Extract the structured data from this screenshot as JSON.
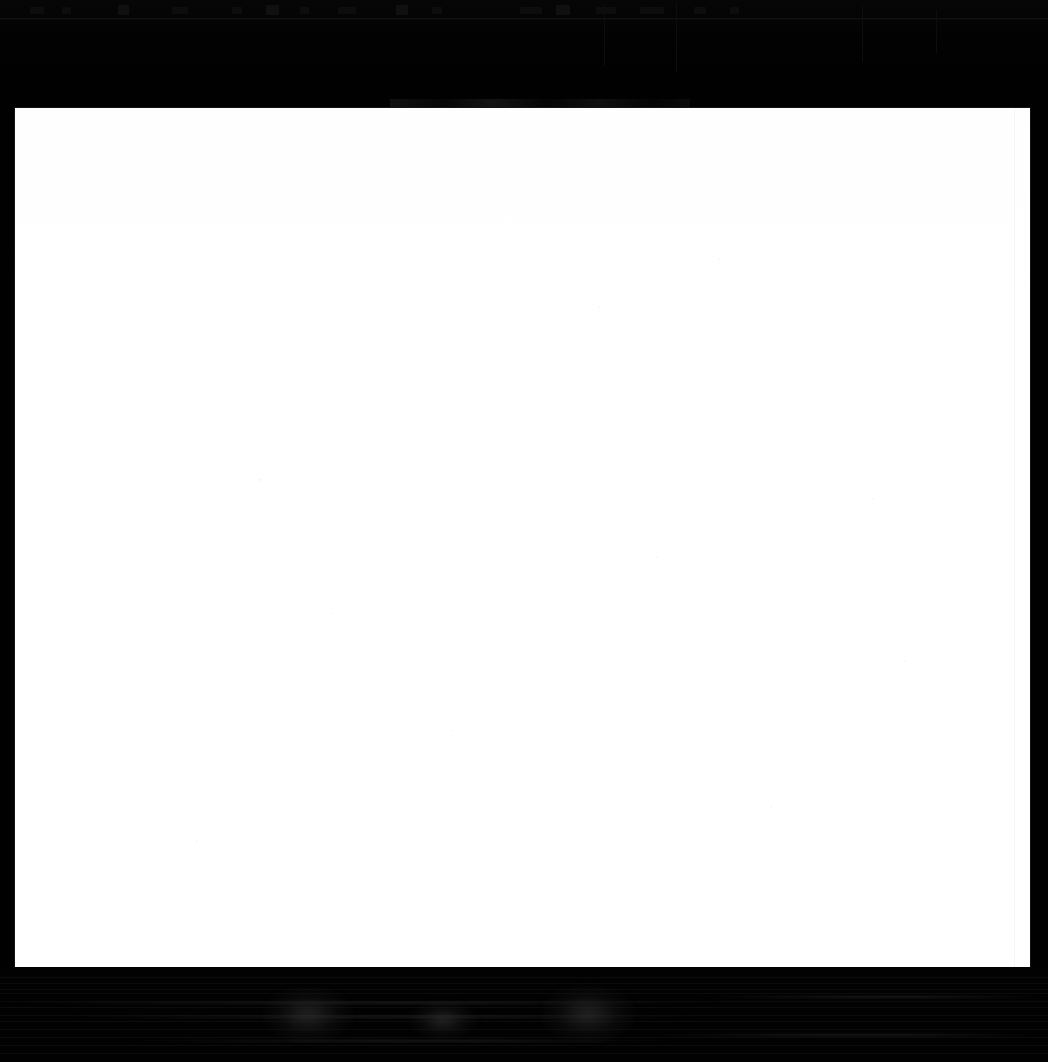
{
  "screen": {
    "width": 1048,
    "height": 1062,
    "description": "Severely underexposed computer-use screenshot: near-black window chrome surrounding a large blank white content panel. No text is legible anywhere in the capture.",
    "background_color": "#030303"
  },
  "colors": {
    "chrome_black": "#030303",
    "chrome_divider": "#141414",
    "ghost_mark": "#0e0e0e",
    "panel_white": "#ffffff",
    "panel_offwhite": "#fefefe",
    "panel_speckle": "#f4f4f4",
    "bottom_band": "#020202",
    "bottom_scanline": "#101010"
  },
  "top_chrome": {
    "region_name": "top-chrome-band",
    "x": 0,
    "y": 0,
    "width": 1048,
    "height": 108,
    "legible_text": "",
    "divider_y": 18,
    "ghost_marks": [
      {
        "x": 30,
        "width": 14,
        "tall": false
      },
      {
        "x": 62,
        "width": 9,
        "tall": false
      },
      {
        "x": 118,
        "width": 11,
        "tall": true
      },
      {
        "x": 172,
        "width": 16,
        "tall": false
      },
      {
        "x": 232,
        "width": 10,
        "tall": false
      },
      {
        "x": 266,
        "width": 13,
        "tall": true
      },
      {
        "x": 300,
        "width": 9,
        "tall": false
      },
      {
        "x": 338,
        "width": 18,
        "tall": false
      },
      {
        "x": 396,
        "width": 12,
        "tall": true
      },
      {
        "x": 432,
        "width": 10,
        "tall": false
      },
      {
        "x": 520,
        "width": 22,
        "tall": false
      },
      {
        "x": 556,
        "width": 14,
        "tall": true
      },
      {
        "x": 596,
        "width": 20,
        "tall": false
      },
      {
        "x": 640,
        "width": 24,
        "tall": false
      },
      {
        "x": 694,
        "width": 12,
        "tall": false
      },
      {
        "x": 730,
        "width": 9,
        "tall": false
      }
    ],
    "ghost_seams": [
      {
        "x": 604,
        "y": 4,
        "height": 62
      },
      {
        "x": 676,
        "y": 2,
        "height": 70
      },
      {
        "x": 862,
        "y": 6,
        "height": 56
      },
      {
        "x": 936,
        "y": 10,
        "height": 44
      }
    ],
    "ghost_textband": {
      "name": "unreadable-text-strip",
      "x": 390,
      "y": 99,
      "width": 300,
      "height": 8,
      "legible_text": ""
    }
  },
  "content_panel": {
    "region_name": "main-content-panel",
    "x": 15,
    "y": 108,
    "width": 1015,
    "height": 859,
    "fill": "#ffffff",
    "legible_text": "",
    "is_blank": true,
    "seam_x": 1014,
    "speckles": [
      {
        "x": 258,
        "y": 478,
        "size": 3
      },
      {
        "x": 330,
        "y": 612,
        "size": 2
      },
      {
        "x": 718,
        "y": 258,
        "size": 2
      },
      {
        "x": 872,
        "y": 498,
        "size": 2
      },
      {
        "x": 656,
        "y": 556,
        "size": 2
      },
      {
        "x": 598,
        "y": 306,
        "size": 2
      },
      {
        "x": 452,
        "y": 730,
        "size": 2
      },
      {
        "x": 904,
        "y": 660,
        "size": 2
      },
      {
        "x": 196,
        "y": 840,
        "size": 2
      },
      {
        "x": 770,
        "y": 806,
        "size": 2
      }
    ]
  },
  "bottom_chrome": {
    "region_name": "bottom-chrome-band",
    "x": 0,
    "y": 967,
    "width": 1048,
    "height": 95,
    "legible_text": "",
    "scanlines_y": [
      10,
      16,
      22,
      26,
      34,
      40,
      48,
      54,
      62,
      70,
      78,
      86
    ],
    "blobs": [
      {
        "x": 262,
        "y": 986,
        "width": 92,
        "height": 58
      },
      {
        "x": 540,
        "y": 984,
        "width": 96,
        "height": 60
      },
      {
        "x": 408,
        "y": 1000,
        "width": 70,
        "height": 40
      }
    ],
    "streaks": [
      {
        "x": 0,
        "y": 1002,
        "width": 720
      },
      {
        "x": 60,
        "y": 1016,
        "width": 640
      },
      {
        "x": 700,
        "y": 996,
        "width": 348
      },
      {
        "x": 120,
        "y": 1040,
        "width": 560
      },
      {
        "x": 640,
        "y": 1034,
        "width": 408
      }
    ]
  }
}
